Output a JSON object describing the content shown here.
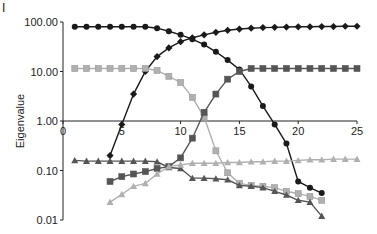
{
  "panel_label": "I",
  "chart_data": {
    "type": "line",
    "title": "",
    "xlabel": "",
    "ylabel": "Eigenvalue",
    "yscale": "log",
    "xlim": [
      0,
      25
    ],
    "ylim": [
      0.01,
      100
    ],
    "x_ticks": [
      "0",
      "5",
      "10",
      "15",
      "20",
      "25"
    ],
    "y_ticks": [
      "100.00",
      "10.00",
      "1.00",
      "0.10",
      "0.01"
    ],
    "grid": false,
    "legend": "none",
    "series": [
      {
        "name": "series-black-circle",
        "marker": "circle",
        "color": "#1a1a1a",
        "x": [
          1,
          2,
          3,
          4,
          5,
          6,
          7,
          8,
          9,
          10,
          11,
          12,
          13,
          14,
          15,
          16,
          17,
          18,
          19,
          20,
          21,
          22
        ],
        "values": [
          80,
          80,
          80,
          80,
          80,
          80,
          80,
          75,
          65,
          55,
          45,
          35,
          25,
          17,
          11,
          5,
          2,
          0.85,
          0.35,
          0.06,
          0.045,
          0.035
        ]
      },
      {
        "name": "series-black-diamond",
        "marker": "diamond",
        "color": "#1a1a1a",
        "x": [
          4,
          5,
          6,
          7,
          8,
          9,
          10,
          11,
          12,
          13,
          14,
          15,
          16,
          17,
          18,
          19,
          20,
          21,
          22,
          23,
          24,
          25
        ],
        "values": [
          0.2,
          0.85,
          3.5,
          10,
          20,
          30,
          40,
          48,
          55,
          62,
          68,
          72,
          75,
          77,
          78,
          79,
          80,
          80,
          81,
          81,
          82,
          82
        ]
      },
      {
        "name": "series-light-square",
        "marker": "square",
        "color": "#b0b0b0",
        "x": [
          1,
          2,
          3,
          4,
          5,
          6,
          7,
          8,
          9,
          10,
          11,
          12,
          13,
          14,
          15,
          16,
          17,
          18,
          19,
          20,
          21,
          22
        ],
        "values": [
          11.5,
          11.5,
          11.5,
          11.5,
          11.5,
          11.5,
          11.5,
          10.5,
          8,
          6,
          3,
          1.2,
          0.25,
          0.09,
          0.055,
          0.05,
          0.048,
          0.045,
          0.038,
          0.034,
          0.03,
          0.025
        ]
      },
      {
        "name": "series-dark-square",
        "marker": "square",
        "color": "#555555",
        "x": [
          4,
          5,
          6,
          7,
          8,
          9,
          10,
          11,
          12,
          13,
          14,
          15,
          16,
          17,
          18,
          19,
          20,
          21,
          22,
          23,
          24,
          25
        ],
        "values": [
          0.06,
          0.075,
          0.085,
          0.095,
          0.11,
          0.12,
          0.18,
          0.45,
          1.5,
          3.5,
          7,
          10,
          11.5,
          11.5,
          11.5,
          11.5,
          11.5,
          11.5,
          11.5,
          11.5,
          11.5,
          11.5
        ]
      },
      {
        "name": "series-dark-triangle",
        "marker": "triangle",
        "color": "#555555",
        "x": [
          1,
          2,
          3,
          4,
          5,
          6,
          7,
          8,
          9,
          10,
          11,
          12,
          13,
          14,
          15,
          16,
          17,
          18,
          19,
          20,
          21,
          22
        ],
        "values": [
          0.16,
          0.155,
          0.155,
          0.155,
          0.155,
          0.155,
          0.155,
          0.15,
          0.115,
          0.11,
          0.07,
          0.07,
          0.068,
          0.065,
          0.05,
          0.048,
          0.045,
          0.038,
          0.032,
          0.025,
          0.023,
          0.012
        ]
      },
      {
        "name": "series-light-triangle",
        "marker": "triangle",
        "color": "#b0b0b0",
        "x": [
          4,
          5,
          6,
          7,
          8,
          9,
          10,
          11,
          12,
          13,
          14,
          15,
          16,
          17,
          18,
          19,
          20,
          21,
          22,
          23,
          24,
          25
        ],
        "values": [
          0.023,
          0.033,
          0.048,
          0.055,
          0.085,
          0.12,
          0.13,
          0.14,
          0.14,
          0.14,
          0.145,
          0.145,
          0.15,
          0.15,
          0.155,
          0.155,
          0.16,
          0.165,
          0.165,
          0.17,
          0.17,
          0.17
        ]
      }
    ]
  }
}
